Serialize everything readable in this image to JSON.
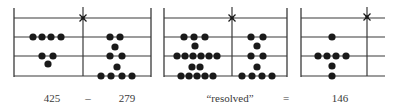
{
  "figure": {
    "line_color": "#3a3a3a",
    "counter_color": "#1a1a1a",
    "line_rows_y": [
      18,
      37,
      56,
      76
    ],
    "panel_top_y": 8,
    "panel_bottom_y": 77,
    "counter_radius": 3.6,
    "panels": [
      {
        "name": "panel-425-minus-279",
        "left_x": 14,
        "right_x": 151,
        "right_border": true,
        "divider_x": 83,
        "star": {
          "x": 83,
          "y": 18
        },
        "counters": [
          {
            "x": 33,
            "y": 37
          },
          {
            "x": 42,
            "y": 37
          },
          {
            "x": 51,
            "y": 37
          },
          {
            "x": 61,
            "y": 37
          },
          {
            "x": 42,
            "y": 56
          },
          {
            "x": 53,
            "y": 56
          },
          {
            "x": 48,
            "y": 64
          },
          {
            "x": 110,
            "y": 37
          },
          {
            "x": 120,
            "y": 37
          },
          {
            "x": 115,
            "y": 47
          },
          {
            "x": 110,
            "y": 56
          },
          {
            "x": 122,
            "y": 56
          },
          {
            "x": 117,
            "y": 67
          },
          {
            "x": 101,
            "y": 76
          },
          {
            "x": 111,
            "y": 76
          },
          {
            "x": 122,
            "y": 76
          },
          {
            "x": 132,
            "y": 76
          }
        ]
      },
      {
        "name": "panel-resolved",
        "left_x": 164,
        "right_x": 287,
        "right_border": true,
        "divider_x": 232,
        "star": {
          "x": 232,
          "y": 18
        },
        "counters": [
          {
            "x": 184,
            "y": 37
          },
          {
            "x": 194,
            "y": 37
          },
          {
            "x": 205,
            "y": 37
          },
          {
            "x": 195,
            "y": 46
          },
          {
            "x": 177,
            "y": 56
          },
          {
            "x": 185,
            "y": 56
          },
          {
            "x": 193,
            "y": 56
          },
          {
            "x": 201,
            "y": 56
          },
          {
            "x": 209,
            "y": 56
          },
          {
            "x": 217,
            "y": 56
          },
          {
            "x": 192,
            "y": 67
          },
          {
            "x": 200,
            "y": 67
          },
          {
            "x": 181,
            "y": 76
          },
          {
            "x": 189,
            "y": 76
          },
          {
            "x": 197,
            "y": 76
          },
          {
            "x": 205,
            "y": 76
          },
          {
            "x": 213,
            "y": 76
          },
          {
            "x": 251,
            "y": 37
          },
          {
            "x": 263,
            "y": 37
          },
          {
            "x": 257,
            "y": 46
          },
          {
            "x": 251,
            "y": 56
          },
          {
            "x": 263,
            "y": 56
          },
          {
            "x": 257,
            "y": 67
          },
          {
            "x": 242,
            "y": 76
          },
          {
            "x": 252,
            "y": 76
          },
          {
            "x": 262,
            "y": 76
          },
          {
            "x": 272,
            "y": 76
          }
        ]
      },
      {
        "name": "panel-146",
        "left_x": 301,
        "right_x": 385,
        "right_border": false,
        "divider_x": 367,
        "star": {
          "x": 367,
          "y": 17
        },
        "counters": [
          {
            "x": 332,
            "y": 37
          },
          {
            "x": 318,
            "y": 56
          },
          {
            "x": 327,
            "y": 56
          },
          {
            "x": 336,
            "y": 56
          },
          {
            "x": 346,
            "y": 56
          },
          {
            "x": 332,
            "y": 66
          },
          {
            "x": 332,
            "y": 76
          }
        ]
      }
    ]
  },
  "labels": [
    {
      "name": "label-minuend",
      "text": "425",
      "x": 52
    },
    {
      "name": "label-minus-sign",
      "text": "–",
      "x": 88
    },
    {
      "name": "label-subtrahend",
      "text": "279",
      "x": 127
    },
    {
      "name": "label-resolved",
      "text": "“resolved”",
      "x": 230
    },
    {
      "name": "label-equals-sign",
      "text": "=",
      "x": 286
    },
    {
      "name": "label-result",
      "text": "146",
      "x": 340
    }
  ]
}
